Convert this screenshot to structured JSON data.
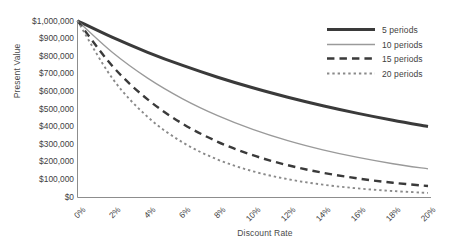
{
  "chart_data": {
    "type": "line",
    "title": "",
    "xlabel": "Discount Rate",
    "ylabel": "Present Value",
    "x": [
      0,
      2,
      4,
      6,
      8,
      10,
      12,
      14,
      16,
      18,
      20
    ],
    "xtick_labels": [
      "0%",
      "2%",
      "4%",
      "6%",
      "8%",
      "10%",
      "12%",
      "14%",
      "16%",
      "18%",
      "20%"
    ],
    "ytick_labels": [
      "$1,000,000",
      "$900,000",
      "$800,000",
      "$700,000",
      "$600,000",
      "$500,000",
      "$400,000",
      "$300,000",
      "$200,000",
      "$100,000",
      "$0"
    ],
    "ytick_values": [
      1000000,
      900000,
      800000,
      700000,
      600000,
      500000,
      400000,
      300000,
      200000,
      100000,
      0
    ],
    "xlim": [
      0,
      20
    ],
    "ylim": [
      0,
      1000000
    ],
    "grid": false,
    "legend_position": "top-right",
    "series": [
      {
        "name": "5 periods",
        "periods": 5,
        "style": "solid-thick",
        "color": "#3a3a3a",
        "width": 3.0,
        "values": [
          1000000,
          905731,
          821927,
          747258,
          680583,
          620921,
          567427,
          519369,
          476113,
          437109,
          401878
        ]
      },
      {
        "name": "10 periods",
        "periods": 10,
        "style": "solid-thin",
        "color": "#9a9a9a",
        "width": 1.3,
        "values": [
          1000000,
          820348,
          675564,
          558395,
          463193,
          385543,
          321973,
          269744,
          226684,
          191064,
          161506
        ]
      },
      {
        "name": "15 periods",
        "periods": 15,
        "style": "dash-long",
        "color": "#3a3a3a",
        "width": 2.4,
        "values": [
          1000000,
          743015,
          555265,
          417265,
          315242,
          239392,
          182696,
          140096,
          107927,
          83516,
          64905
        ]
      },
      {
        "name": "20 periods",
        "periods": 20,
        "style": "dash-short",
        "color": "#8a8a8a",
        "width": 1.9,
        "values": [
          1000000,
          672971,
          456387,
          311805,
          214548,
          148644,
          103667,
          72762,
          51385,
          36506,
          26084
        ]
      }
    ]
  },
  "legend": {
    "items": [
      {
        "label": "5 periods"
      },
      {
        "label": "10 periods"
      },
      {
        "label": "15 periods"
      },
      {
        "label": "20 periods"
      }
    ]
  },
  "colors": {
    "dark_line": "#3a3a3a",
    "gray_line": "#9a9a9a",
    "axis": "#888888",
    "text": "#3f3f3f",
    "background": "#ffffff"
  }
}
